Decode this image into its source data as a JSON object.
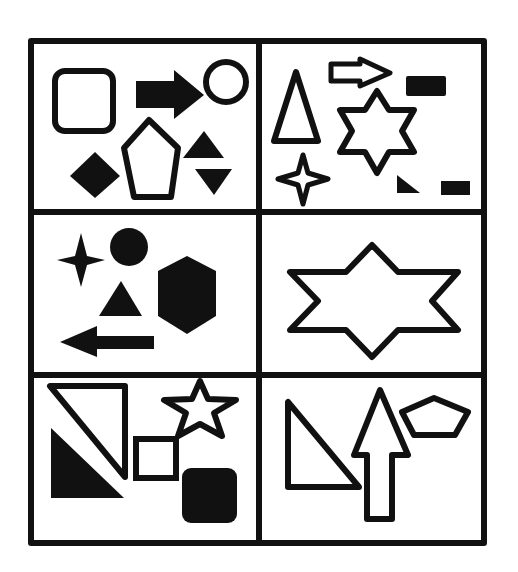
{
  "figure": {
    "type": "shape-grid-puzzle",
    "rows": 3,
    "cols": 2,
    "background": "#ffffff",
    "ink": "#111111",
    "cells": [
      {
        "id": "r1c1",
        "shapes": [
          "outline-rounded-square",
          "filled-right-arrow",
          "outline-circle",
          "filled-diamond",
          "outline-pentagon",
          "filled-triangle-up",
          "filled-triangle-down"
        ]
      },
      {
        "id": "r1c2",
        "shapes": [
          "outline-tall-triangle",
          "outline-right-arrow",
          "filled-rectangle",
          "outline-six-point-star",
          "outline-four-point-star",
          "filled-right-triangle",
          "filled-small-rectangle"
        ]
      },
      {
        "id": "r2c1",
        "shapes": [
          "filled-four-point-star",
          "filled-circle",
          "filled-triangle",
          "filled-hexagon",
          "filled-left-arrow"
        ]
      },
      {
        "id": "r2c2",
        "shapes": [
          "outline-wide-six-point-star"
        ]
      },
      {
        "id": "r3c1",
        "shapes": [
          "outline-right-triangle",
          "filled-right-triangle",
          "outline-five-point-star",
          "outline-square",
          "filled-rounded-square"
        ]
      },
      {
        "id": "r3c2",
        "shapes": [
          "outline-right-triangle",
          "outline-up-arrow",
          "outline-pentagon"
        ]
      }
    ]
  }
}
